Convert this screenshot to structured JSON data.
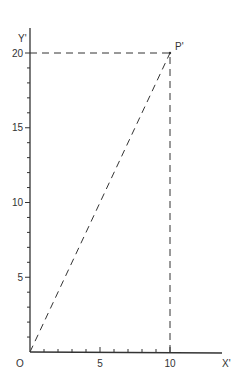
{
  "chart_data": {
    "type": "line",
    "title": "",
    "xlabel": "X'",
    "ylabel": "Y'",
    "origin_label": "O",
    "xlim": [
      0,
      11.5
    ],
    "ylim": [
      0,
      20
    ],
    "x_ticks": [
      5,
      10
    ],
    "y_ticks": [
      5,
      10,
      15,
      20
    ],
    "x_minor_step": 1,
    "y_minor_step": 1,
    "grid": false,
    "series": [
      {
        "name": "OP'",
        "style": "dashed",
        "x": [
          0,
          10
        ],
        "y": [
          0,
          20
        ]
      }
    ],
    "projections": [
      {
        "name": "horizontal-to-y",
        "style": "dashed",
        "x": [
          0,
          10
        ],
        "y": [
          20,
          20
        ]
      },
      {
        "name": "vertical-to-x",
        "style": "dashed",
        "x": [
          10,
          10
        ],
        "y": [
          0,
          20
        ]
      }
    ],
    "points": [
      {
        "label": "P'",
        "x": 10,
        "y": 20
      }
    ]
  }
}
